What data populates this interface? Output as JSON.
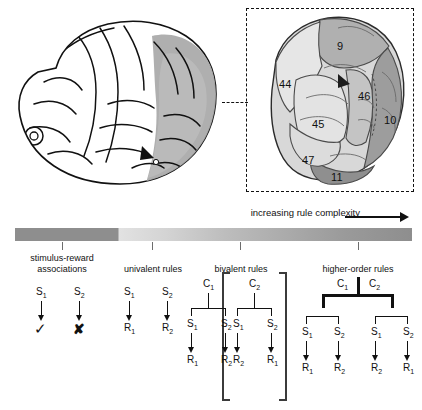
{
  "figure": {
    "top_panel": {
      "brain_lateral": {
        "name": "lateral view of human brain with shaded prefrontal cortex"
      },
      "inset": {
        "name": "magnified prefrontal cortex with Brodmann areas",
        "areas": [
          {
            "label": "9",
            "x": 342,
            "y": 46
          },
          {
            "label": "44",
            "x": 286,
            "y": 84
          },
          {
            "label": "46",
            "x": 364,
            "y": 96
          },
          {
            "label": "45",
            "x": 318,
            "y": 124
          },
          {
            "label": "10",
            "x": 389,
            "y": 120
          },
          {
            "label": "47",
            "x": 308,
            "y": 160
          },
          {
            "label": "11",
            "x": 337,
            "y": 177
          }
        ]
      }
    },
    "bottom_panel": {
      "complexity_note": "increasing rule complexity",
      "gradient_colors": {
        "dark": "#8e8e8e",
        "light": "#e2e2e2"
      },
      "ticks": [
        62,
        152,
        240,
        358
      ],
      "segments": [
        {
          "id": "stimulus-reward",
          "line1": "stimulus-reward",
          "line2": "associations",
          "center": 62
        },
        {
          "id": "univalent",
          "line1": "univalent rules",
          "line2": "",
          "center": 152
        },
        {
          "id": "bivalent",
          "line1": "bivalent rules",
          "line2": "",
          "center": 240
        },
        {
          "id": "higher-order",
          "line1": "higher-order rules",
          "line2": "",
          "center": 358
        }
      ],
      "rule_sets": {
        "stimulus_reward": {
          "stimuli": [
            "S",
            "S"
          ],
          "stimuli_sub": [
            "1",
            "2"
          ],
          "outcomes": [
            "✓",
            "✘"
          ]
        },
        "univalent": {
          "stimuli_sub": [
            "1",
            "2"
          ],
          "responses_sub": [
            "1",
            "2"
          ]
        },
        "bivalent": {
          "contexts_sub": [
            "1",
            "2"
          ],
          "group1": {
            "stimuli_sub": [
              "1",
              "2"
            ],
            "responses_sub": [
              "1",
              "2"
            ]
          },
          "group2": {
            "stimuli_sub": [
              "1",
              "2"
            ],
            "responses_sub": [
              "2",
              "1"
            ]
          }
        },
        "higher_order": {
          "contexts_sub": [
            "1",
            "2"
          ],
          "group1": {
            "stimuli_sub": [
              "1",
              "2"
            ],
            "responses_sub": [
              "1",
              "2"
            ]
          },
          "group2": {
            "stimuli_sub": [
              "1",
              "2"
            ],
            "responses_sub": [
              "2",
              "1"
            ]
          }
        }
      },
      "symbols": {
        "stimulus": "S",
        "response": "R",
        "context": "C",
        "check": "✓",
        "cross": "✘"
      }
    }
  }
}
